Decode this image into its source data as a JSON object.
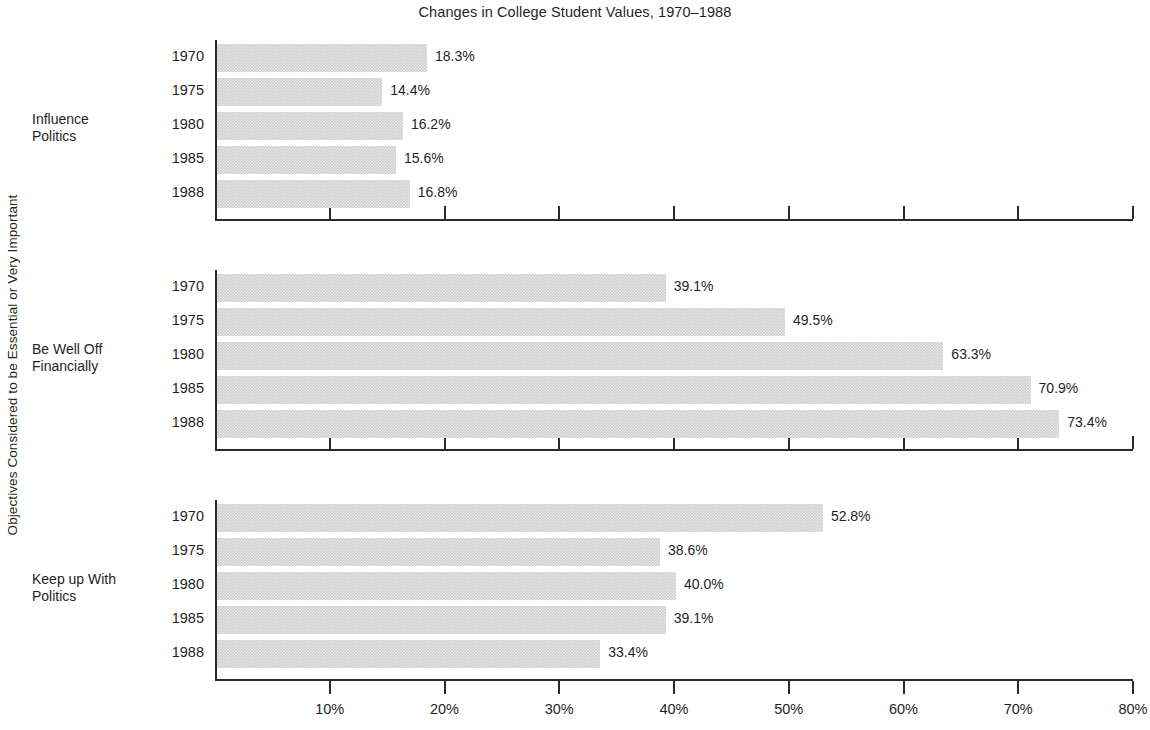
{
  "chart_data": {
    "type": "bar",
    "orientation": "horizontal",
    "title": "Changes in College Student Values, 1970–1988",
    "ylabel": "Objectives Considered to be Essential or Very Important",
    "xlabel": "",
    "xlim": [
      0,
      80
    ],
    "xunit": "%",
    "grid": false,
    "legend": null,
    "xticks": [
      {
        "value": 10,
        "label": "10%"
      },
      {
        "value": 20,
        "label": "20%"
      },
      {
        "value": 30,
        "label": "30%"
      },
      {
        "value": 40,
        "label": "40%"
      },
      {
        "value": 50,
        "label": "50%"
      },
      {
        "value": 60,
        "label": "60%"
      },
      {
        "value": 70,
        "label": "70%"
      },
      {
        "value": 80,
        "label": "80%"
      }
    ],
    "categories": [
      "1970",
      "1975",
      "1980",
      "1985",
      "1988"
    ],
    "panels": [
      {
        "name": "influence-politics",
        "label_lines": [
          "Influence",
          "Politics"
        ],
        "values": [
          18.3,
          16.2,
          15.6,
          14.4,
          16.8
        ],
        "bars": [
          {
            "category": "1970",
            "value": 18.3,
            "label": "18.3%"
          },
          {
            "category": "1975",
            "value": 14.4,
            "label": "14.4%"
          },
          {
            "category": "1980",
            "value": 16.2,
            "label": "16.2%"
          },
          {
            "category": "1985",
            "value": 15.6,
            "label": "15.6%"
          },
          {
            "category": "1988",
            "value": 16.8,
            "label": "16.8%"
          }
        ]
      },
      {
        "name": "be-well-off-financially",
        "label_lines": [
          "Be Well Off",
          "Financially"
        ],
        "values": [
          39.1,
          49.5,
          63.3,
          70.9,
          73.4
        ],
        "bars": [
          {
            "category": "1970",
            "value": 39.1,
            "label": "39.1%"
          },
          {
            "category": "1975",
            "value": 49.5,
            "label": "49.5%"
          },
          {
            "category": "1980",
            "value": 63.3,
            "label": "63.3%"
          },
          {
            "category": "1985",
            "value": 70.9,
            "label": "70.9%"
          },
          {
            "category": "1988",
            "value": 73.4,
            "label": "73.4%"
          }
        ]
      },
      {
        "name": "keep-up-with-politics",
        "label_lines": [
          "Keep up With",
          "Politics"
        ],
        "values": [
          52.8,
          38.6,
          40.0,
          39.1,
          33.4
        ],
        "bars": [
          {
            "category": "1970",
            "value": 52.8,
            "label": "52.8%"
          },
          {
            "category": "1975",
            "value": 38.6,
            "label": "38.6%"
          },
          {
            "category": "1980",
            "value": 40.0,
            "label": "40.0%"
          },
          {
            "category": "1985",
            "value": 39.1,
            "label": "39.1%"
          },
          {
            "category": "1988",
            "value": 33.4,
            "label": "33.4%"
          }
        ]
      }
    ],
    "colors": {
      "bar_fill": "#cfcfcf",
      "axis": "#2a2a2a",
      "text": "#1f1f1f",
      "background": "#ffffff"
    }
  }
}
